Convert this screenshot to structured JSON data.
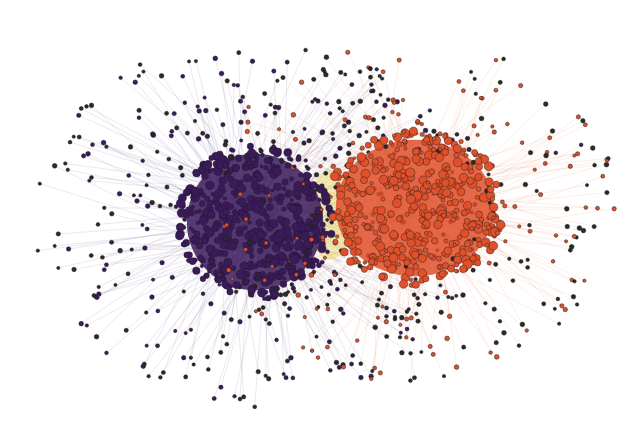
{
  "diagram": {
    "type": "network-graph",
    "layout": "force-directed",
    "background": "#ffffff",
    "clusters": [
      {
        "name": "purple-community",
        "color": "#3b1a5c",
        "edge_color": "#8a7aa0",
        "center": [
          255,
          222
        ],
        "core_radius": [
          62,
          62
        ],
        "halo_radius": [
          200,
          170
        ],
        "core_nodes": 520,
        "halo_nodes": 330,
        "seed": 11
      },
      {
        "name": "orange-community",
        "color": "#e0502a",
        "edge_color": "#f0a080",
        "center": [
          415,
          208
        ],
        "core_radius": [
          72,
          62
        ],
        "halo_radius": [
          185,
          160
        ],
        "core_nodes": 430,
        "halo_nodes": 300,
        "seed": 29
      }
    ],
    "bridge": {
      "name": "yellow-bridge",
      "color": "#e8d870",
      "center": [
        330,
        215
      ],
      "radius": [
        22,
        45
      ]
    },
    "node_outline": "#1a1a1a",
    "labels": []
  }
}
